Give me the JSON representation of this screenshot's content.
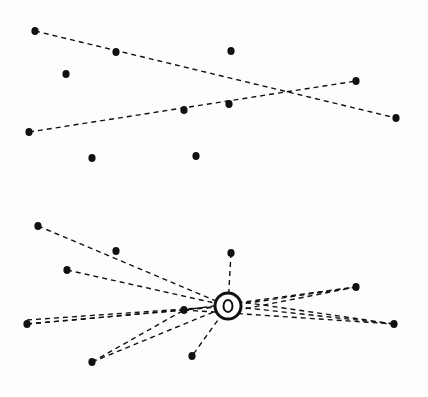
{
  "diagram": {
    "panels": [
      {
        "name": "top-panel",
        "dots": [
          [
            35,
            31
          ],
          [
            116,
            52
          ],
          [
            66,
            74
          ],
          [
            231,
            51
          ],
          [
            356,
            81
          ],
          [
            184,
            110
          ],
          [
            229,
            104
          ],
          [
            29,
            132
          ],
          [
            92,
            158
          ],
          [
            196,
            156
          ],
          [
            396,
            118
          ]
        ],
        "lines": [
          [
            [
              35,
              31
            ],
            [
              396,
              118
            ]
          ],
          [
            [
              29,
              132
            ],
            [
              356,
              81
            ]
          ]
        ]
      },
      {
        "name": "bottom-panel",
        "hub": {
          "x": 228,
          "y": 306,
          "outer_r": 13,
          "inner_rx": 4.5,
          "inner_ry": 6
        },
        "dots": [
          [
            38,
            226
          ],
          [
            116,
            251
          ],
          [
            67,
            270
          ],
          [
            231,
            253
          ],
          [
            356,
            287
          ],
          [
            27,
            324
          ],
          [
            184,
            310
          ],
          [
            394,
            324
          ],
          [
            92,
            362
          ],
          [
            192,
            356
          ]
        ],
        "lines": [
          [
            [
              38,
              226
            ],
            [
              228,
              306
            ]
          ],
          [
            [
              67,
              270
            ],
            [
              228,
              306
            ]
          ],
          [
            [
              231,
              253
            ],
            [
              228,
              306
            ]
          ],
          [
            [
              27,
              324
            ],
            [
              228,
              306
            ]
          ],
          [
            [
              27,
              320
            ],
            [
              228,
              306
            ]
          ],
          [
            [
              92,
              362
            ],
            [
              228,
              306
            ]
          ],
          [
            [
              228,
              306
            ],
            [
              192,
              356
            ]
          ],
          [
            [
              228,
              306
            ],
            [
              356,
              287
            ]
          ],
          [
            [
              228,
              306
            ],
            [
              394,
              324
            ]
          ],
          [
            [
              184,
              310
            ],
            [
              356,
              287
            ]
          ],
          [
            [
              184,
              310
            ],
            [
              394,
              324
            ]
          ],
          [
            [
              27,
              324
            ],
            [
              184,
              310
            ]
          ],
          [
            [
              92,
              362
            ],
            [
              184,
              310
            ]
          ],
          [
            [
              228,
              300
            ],
            [
              394,
              324
            ]
          ],
          [
            [
              228,
              312
            ],
            [
              356,
              287
            ]
          ]
        ]
      }
    ],
    "colors": {
      "ink": "#111111",
      "background": "#fdfdfd"
    }
  }
}
